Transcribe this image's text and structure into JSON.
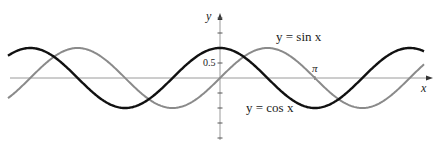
{
  "chart_data": {
    "type": "line",
    "title": "",
    "xlabel": "x",
    "ylabel": "y",
    "xlim": [
      -6.9,
      6.9
    ],
    "ylim": [
      -2.1,
      2.1
    ],
    "grid": false,
    "tick_labels": {
      "y": [
        "0.5"
      ],
      "x": [
        "π"
      ]
    },
    "annotations": [
      "y = sin x",
      "y = cos x",
      "0.5",
      "π"
    ],
    "series": [
      {
        "name": "y = sin x",
        "function": "sin(x)",
        "color": "#8a8a8a",
        "x": [
          -6.283,
          -4.712,
          -3.142,
          -1.571,
          0,
          1.571,
          3.142,
          4.712,
          6.283
        ],
        "values": [
          0,
          1,
          0,
          -1,
          0,
          1,
          0,
          -1,
          0
        ]
      },
      {
        "name": "y = cos x",
        "function": "cos(x)",
        "color": "#111111",
        "x": [
          -6.283,
          -4.712,
          -3.142,
          -1.571,
          0,
          1.571,
          3.142,
          4.712,
          6.283
        ],
        "values": [
          1,
          0,
          -1,
          0,
          1,
          0,
          -1,
          0,
          1
        ]
      }
    ]
  },
  "labels": {
    "sin_label": "y = sin x",
    "cos_label": "y = cos x",
    "y_axis": "y",
    "x_axis": "x",
    "tick_half": "0.5",
    "tick_pi": "π"
  }
}
